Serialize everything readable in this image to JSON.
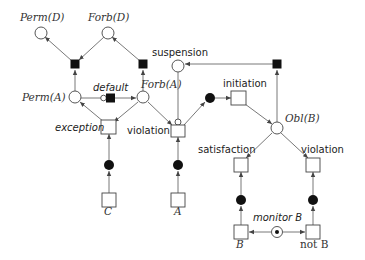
{
  "diagram": {
    "type": "petri-net",
    "colors": {
      "line": "#555555",
      "fill_black": "#111111",
      "background": "#ffffff"
    },
    "labels": {
      "perm_d": "Perm(D)",
      "forb_d": "Forb(D)",
      "perm_a": "Perm(A)",
      "forb_a": "Forb(A)",
      "default": "default",
      "suspension": "suspension",
      "initiation": "initiation",
      "obl_b": "Obl(B)",
      "exception": "exception",
      "violation_left": "violation",
      "satisfaction": "satisfaction",
      "violation_right": "violation",
      "c": "C",
      "a": "A",
      "monitor_b": "monitor B",
      "b": "B",
      "not_b": "not B"
    },
    "nodes": [
      {
        "id": "perm_d",
        "kind": "place"
      },
      {
        "id": "forb_d",
        "kind": "place"
      },
      {
        "id": "t_perm_d",
        "kind": "black-transition"
      },
      {
        "id": "t_forb_d",
        "kind": "black-transition"
      },
      {
        "id": "perm_a",
        "kind": "place"
      },
      {
        "id": "default",
        "kind": "black-transition-with-inhibitor"
      },
      {
        "id": "forb_a",
        "kind": "place"
      },
      {
        "id": "suspension",
        "kind": "place"
      },
      {
        "id": "t_suspension",
        "kind": "black-transition"
      },
      {
        "id": "initiation",
        "kind": "transition"
      },
      {
        "id": "init_token",
        "kind": "token-place"
      },
      {
        "id": "obl_b",
        "kind": "place"
      },
      {
        "id": "exception",
        "kind": "transition"
      },
      {
        "id": "violation_left",
        "kind": "transition"
      },
      {
        "id": "satisfaction",
        "kind": "transition"
      },
      {
        "id": "violation_right",
        "kind": "transition"
      },
      {
        "id": "c",
        "kind": "transition"
      },
      {
        "id": "a",
        "kind": "transition"
      },
      {
        "id": "b",
        "kind": "transition"
      },
      {
        "id": "not_b",
        "kind": "transition"
      },
      {
        "id": "monitor_b",
        "kind": "marked-place"
      }
    ]
  }
}
